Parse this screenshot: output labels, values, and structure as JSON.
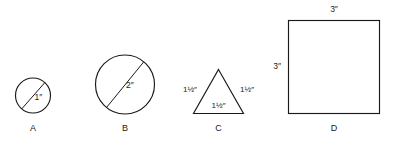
{
  "figure": {
    "background_color": "#ffffff",
    "stroke_color": "#1a1a1a",
    "shapes": [
      {
        "id": "A",
        "kind": "circle",
        "letter_label": "A",
        "dimension_label": "1″",
        "dimension_meaning": "diameter 1 inch"
      },
      {
        "id": "B",
        "kind": "circle",
        "letter_label": "B",
        "dimension_label": "2″",
        "dimension_meaning": "diameter 2 inches"
      },
      {
        "id": "C",
        "kind": "triangle",
        "letter_label": "C",
        "side_left_label": "1½″",
        "side_right_label": "1½″",
        "side_bottom_label": "1½″",
        "dimension_meaning": "equilateral, each side 1 1/2 inches"
      },
      {
        "id": "D",
        "kind": "square",
        "letter_label": "D",
        "side_top_label": "3″",
        "side_left_label": "3″",
        "dimension_meaning": "square, each side 3 inches"
      }
    ]
  }
}
